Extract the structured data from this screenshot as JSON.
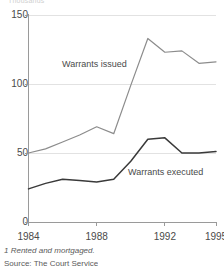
{
  "header": {
    "cut_text": "Thousands"
  },
  "chart_data": {
    "type": "line",
    "title": "",
    "subtitle": "",
    "xlabel": "",
    "ylabel": "",
    "xlim": [
      1984,
      1995
    ],
    "ylim": [
      0,
      150
    ],
    "grid": true,
    "grid_axis": "y",
    "legend_position": "in-plot-annotation",
    "y_ticks": [
      0,
      50,
      100,
      150
    ],
    "y_tick_labels": [
      "0",
      "50",
      "100",
      "150"
    ],
    "x_ticks": [
      1984,
      1988,
      1992,
      1995
    ],
    "x_tick_labels": [
      "1984",
      "1988",
      "1992",
      "1995"
    ],
    "x": [
      1984,
      1985,
      1986,
      1987,
      1988,
      1989,
      1990,
      1991,
      1992,
      1993,
      1994,
      1995
    ],
    "series": [
      {
        "name": "Warrants issued",
        "color": "#8c8c8c",
        "values": [
          50,
          53,
          58,
          63,
          69,
          64,
          99,
          133,
          123,
          124,
          115,
          116
        ]
      },
      {
        "name": "Warrants executed",
        "color": "#3a3a3a",
        "values": [
          24,
          28,
          31,
          30,
          29,
          31,
          44,
          60,
          61,
          50,
          50,
          51
        ]
      }
    ],
    "annotations": [
      {
        "text": "Warrants issued",
        "x": 1987.2,
        "y": 110
      },
      {
        "text": "Warrants executed",
        "x": 1991.5,
        "y": 40
      }
    ]
  },
  "footnotes": {
    "note": "1 Rented and mortgaged.",
    "source": "Source: The Court Service"
  },
  "colors": {
    "issued_line": "#8c8c8c",
    "executed_line": "#3a3a3a",
    "axis": "#9a9a9a",
    "grid": "#e2e2e2",
    "text": "#4a4a4a"
  }
}
